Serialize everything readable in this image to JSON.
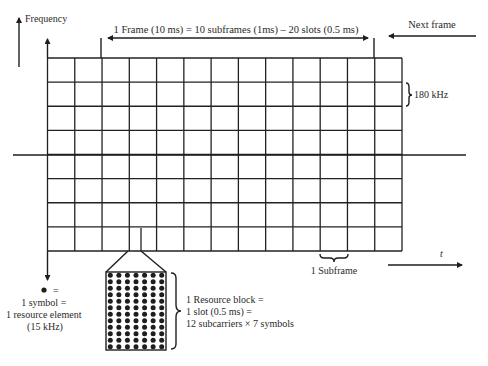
{
  "axes": {
    "frequency_label": "Frequency",
    "time_label": "t"
  },
  "frame": {
    "label": "1 Frame (10 ms) = 10 subframes (1ms) – 20 slots (0.5 ms)",
    "next_frame_label": "Next frame"
  },
  "grid": {
    "columns": 13,
    "rows": 8,
    "row_height_label": "180 kHz",
    "subframe_label": "1 Subframe"
  },
  "resource_element": {
    "symbol": "●",
    "equals": "=",
    "lines": [
      "1 symbol =",
      "1 resource element",
      "(15 kHz)"
    ]
  },
  "resource_block": {
    "dot_columns": 7,
    "dot_rows": 12,
    "lines": [
      "1 Resource block =",
      "1 slot (0.5 ms) =",
      "12 subcarriers × 7 symbols"
    ]
  },
  "colors": {
    "line": "#1e1e1e",
    "text": "#2a2a2a",
    "background": "#ffffff"
  }
}
